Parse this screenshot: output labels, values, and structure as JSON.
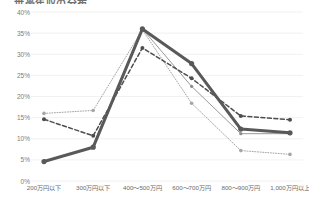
{
  "chart_data": {
    "type": "line",
    "title": "世帯年収の分布",
    "categories": [
      "200万円以下",
      "300万円以下",
      "400～500万円",
      "600～700万円",
      "800～900万円",
      "1,000万円以上"
    ],
    "series": [
      {
        "name": "系列1",
        "style": "thick-solid",
        "color": "#595959",
        "values": [
          4.6,
          8.0,
          36.0,
          27.8,
          12.3,
          11.4
        ]
      },
      {
        "name": "系列2",
        "style": "thin-solid",
        "color": "#8c8c8c",
        "values": [
          4.6,
          8.0,
          36.0,
          22.4,
          11.2,
          11.2
        ]
      },
      {
        "name": "系列3",
        "style": "dashed",
        "color": "#4d4d4d",
        "values": [
          14.6,
          10.7,
          31.5,
          24.3,
          15.4,
          14.5
        ]
      },
      {
        "name": "系列4",
        "style": "dotted",
        "color": "#a6a6a6",
        "values": [
          16.0,
          16.7,
          35.8,
          18.4,
          7.2,
          6.3
        ]
      }
    ],
    "ylabel": "",
    "xlabel": "",
    "ylim": [
      0,
      40
    ],
    "ytick_labels": [
      "40%",
      "35%",
      "30%",
      "25%",
      "20%",
      "15%",
      "10%",
      "5%",
      "0%"
    ],
    "ytick_values": [
      40,
      35,
      30,
      25,
      20,
      15,
      10,
      5,
      0
    ],
    "grid": true,
    "grid_color": "#eeeeee",
    "legend": "none",
    "markers": true
  }
}
